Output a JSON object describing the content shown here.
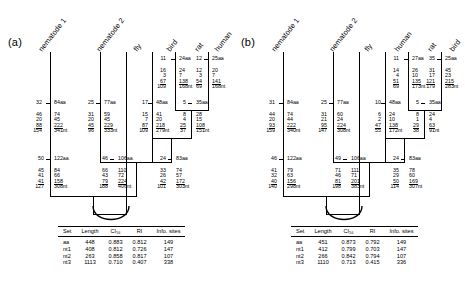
{
  "figure": {
    "panels": [
      {
        "label": "(a)",
        "leaves": [
          "nematode 1",
          "nematode 2",
          "fly",
          "bird",
          "rat",
          "human"
        ],
        "branch_labels": [
          {
            "id": "rat-terminal",
            "aa": "11",
            "nt1": "16",
            "nt2": "3",
            "nt3": "67",
            "total": "109",
            "len": "24aa"
          },
          {
            "id": "human-terminal",
            "aa": "12",
            "nt1": "12",
            "nt2": "3",
            "nt3": "54",
            "total": "69",
            "len": "25aa",
            "lenr": "138",
            "totalr": "168nt"
          },
          {
            "id": "rat-right",
            "v1": "24",
            "v2": "7",
            "v3": "138",
            "v4": "168nt"
          },
          {
            "id": "human-right",
            "v1": "20",
            "v2": "7",
            "v3": "141",
            "v4": "168nt"
          },
          {
            "id": "nem1-node",
            "aa": "32",
            "nt1": "46",
            "nt2": "20",
            "nt3": "88",
            "total": "154",
            "len": "84aa",
            "r1": "74",
            "r2": "45",
            "r3": "222",
            "r4": "341nt"
          },
          {
            "id": "nem2-node",
            "aa": "25",
            "nt1": "31",
            "nt2": "20",
            "nt3": "45",
            "total": "96",
            "len": "77aa",
            "r1": "59",
            "r2": "45",
            "r3": "229",
            "r4": "333nt"
          },
          {
            "id": "bird-node",
            "aa": "17",
            "nt1": "15",
            "nt2": "7",
            "nt3": "87",
            "total": "109",
            "len": "48aa",
            "r1": "41",
            "r2": "20",
            "r3": "218",
            "r4": "279nt"
          },
          {
            "id": "rodent-node",
            "aa": "5",
            "nt1": "8",
            "nt2": "4",
            "nt3": "25",
            "total": "37",
            "len": "35aa",
            "r1": "28",
            "r2": "15",
            "r3": "108",
            "r4": "151nt"
          },
          {
            "id": "inner-left",
            "aa": "50",
            "nt1": "45",
            "nt2": "41",
            "nt3": "41",
            "total": "127",
            "len": "122aa",
            "r1": "84",
            "r2": "66",
            "r3": "158",
            "r4": "308nt"
          },
          {
            "id": "inner-mid",
            "aa": "46",
            "nt1": "66",
            "nt2": "43",
            "nt3": "79",
            "total": "188",
            "len": "106aa",
            "r1": "110",
            "r2": "72",
            "r3": "224",
            "r4": "406nt"
          },
          {
            "id": "inner-right",
            "aa": "24",
            "nt1": "33",
            "nt2": "26",
            "nt3": "42",
            "total": "101",
            "len": "83aa",
            "r1": "74",
            "r2": "57",
            "r3": "172",
            "r4": "303nt"
          }
        ],
        "table": {
          "columns": [
            "Set",
            "Length",
            "CI₅₆",
            "RI",
            "Info. sites"
          ],
          "rows": [
            [
              "aa",
              "448",
              "0.883",
              "0.812",
              "149"
            ],
            [
              "nt1",
              "408",
              "0.812",
              "0.726",
              "147"
            ],
            [
              "nt2",
              "263",
              "0.858",
              "0.817",
              "107"
            ],
            [
              "nt3",
              "1113",
              "0.710",
              "0.407",
              "338"
            ]
          ]
        }
      },
      {
        "label": "(b)",
        "leaves": [
          "nematode 1",
          "nematode 2",
          "fly",
          "human",
          "rat",
          "bird"
        ],
        "branch_labels": [
          {
            "id": "rat-terminal",
            "aa": "11",
            "nt1": "14",
            "nt2": "4",
            "nt3": "51",
            "total": "69",
            "len": "27aa",
            "r1": "26",
            "r2": "10",
            "r3": "135",
            "r4": "173nt"
          },
          {
            "id": "bird-terminal",
            "aa": "35",
            "nt1": "31",
            "nt2": "17",
            "nt3": "121",
            "total": "179",
            "len": "25aa",
            "r1": "45",
            "r2": "23",
            "r3": "215",
            "r4": "283nt"
          },
          {
            "id": "nem1-node",
            "aa": "31",
            "nt1": "44",
            "nt2": "20",
            "nt3": "93",
            "total": "159",
            "len": "84aa",
            "r1": "74",
            "r2": "44",
            "r3": "222",
            "r4": "340nt"
          },
          {
            "id": "nem2-node",
            "aa": "25",
            "nt1": "31",
            "nt2": "21",
            "nt3": "95",
            "total": "147",
            "len": "77aa",
            "r1": "60",
            "r2": "24",
            "r3": "224",
            "r4": "308nt"
          },
          {
            "id": "human-node",
            "aa": "10",
            "nt1": "6",
            "nt2": "2",
            "nt3": "47",
            "total": "55",
            "len": "48aa",
            "r1": "24",
            "r2": "10",
            "r3": "138",
            "r4": "172nt"
          },
          {
            "id": "rodent-node",
            "aa": "5",
            "nt1": "8",
            "nt2": "1",
            "nt3": "29",
            "total": "38",
            "len": "35aa",
            "r1": "24",
            "r2": "4",
            "r3": "63",
            "r4": "91nt"
          },
          {
            "id": "inner-left",
            "aa": "46",
            "nt1": "41",
            "nt2": "32",
            "nt3": "40",
            "total": "140",
            "len": "122aa",
            "r1": "79",
            "r2": "63",
            "r3": "156",
            "r4": "298nt"
          },
          {
            "id": "inner-mid",
            "aa": "49",
            "nt1": "71",
            "nt2": "46",
            "nt3": "81",
            "total": "198",
            "len": "106aa",
            "r1": "111",
            "r2": "71",
            "r3": "201",
            "r4": "383nt"
          },
          {
            "id": "inner-right",
            "aa": "24",
            "nt1": "35",
            "nt2": "29",
            "nt3": "50",
            "total": "114",
            "len": "83aa",
            "r1": "78",
            "r2": "60",
            "r3": "169",
            "r4": "307nt"
          }
        ],
        "table": {
          "columns": [
            "Set",
            "Length",
            "CI₅₆",
            "RI",
            "Info. sites"
          ],
          "rows": [
            [
              "aa",
              "451",
              "0.873",
              "0.792",
              "149"
            ],
            [
              "nt1",
              "412",
              "0.799",
              "0.703",
              "147"
            ],
            [
              "nt2",
              "266",
              "0.842",
              "0.794",
              "107"
            ],
            [
              "nt3",
              "1110",
              "0.713",
              "0.415",
              "336"
            ]
          ]
        }
      }
    ]
  }
}
